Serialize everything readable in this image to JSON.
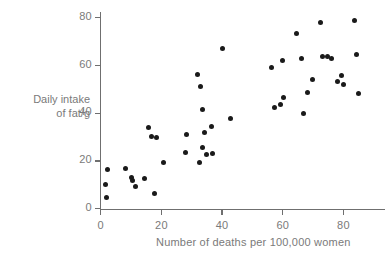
{
  "chart_data": {
    "type": "scatter",
    "title": "",
    "xlabel": "Number of deaths per 100,000 women",
    "ylabel": "Daily intake of fat/g",
    "ylabel_line1": "Daily intake",
    "ylabel_line2": "of fat/g",
    "xlim": [
      0,
      88
    ],
    "ylim": [
      0,
      84
    ],
    "xticks": [
      0,
      20,
      40,
      60,
      80
    ],
    "yticks": [
      0,
      20,
      40,
      60,
      80
    ],
    "xtick_labels": [
      "0",
      "20",
      "40",
      "60",
      "80"
    ],
    "ytick_labels": [
      "0",
      "20",
      "40",
      "60",
      "80"
    ],
    "grid": false,
    "legend": "none",
    "marker_color": "#1a1a1a",
    "axis_color": "#6f6f6f",
    "text_color": "#7a7a7a",
    "points": [
      {
        "x": 2.1,
        "y": 16.6
      },
      {
        "x": 1.5,
        "y": 10.3
      },
      {
        "x": 1.9,
        "y": 4.7
      },
      {
        "x": 8.1,
        "y": 16.8
      },
      {
        "x": 10.1,
        "y": 13.1
      },
      {
        "x": 11.4,
        "y": 9.2
      },
      {
        "x": 10.6,
        "y": 11.9
      },
      {
        "x": 14.5,
        "y": 12.6
      },
      {
        "x": 17.8,
        "y": 6.3
      },
      {
        "x": 15.6,
        "y": 34.2
      },
      {
        "x": 16.9,
        "y": 30.3
      },
      {
        "x": 18.4,
        "y": 30.0
      },
      {
        "x": 20.8,
        "y": 19.4
      },
      {
        "x": 27.8,
        "y": 23.6
      },
      {
        "x": 28.2,
        "y": 31.0
      },
      {
        "x": 31.8,
        "y": 56.2
      },
      {
        "x": 32.8,
        "y": 51.3
      },
      {
        "x": 33.4,
        "y": 41.5
      },
      {
        "x": 32.7,
        "y": 19.4
      },
      {
        "x": 33.5,
        "y": 25.8
      },
      {
        "x": 34.1,
        "y": 31.7
      },
      {
        "x": 34.8,
        "y": 22.8
      },
      {
        "x": 36.4,
        "y": 34.5
      },
      {
        "x": 36.9,
        "y": 23.3
      },
      {
        "x": 40.2,
        "y": 67.2
      },
      {
        "x": 42.7,
        "y": 37.6
      },
      {
        "x": 56.4,
        "y": 59.2
      },
      {
        "x": 57.4,
        "y": 42.4
      },
      {
        "x": 59.3,
        "y": 43.6
      },
      {
        "x": 59.9,
        "y": 62.0
      },
      {
        "x": 60.3,
        "y": 46.5
      },
      {
        "x": 64.5,
        "y": 73.3
      },
      {
        "x": 66.2,
        "y": 62.8
      },
      {
        "x": 66.8,
        "y": 39.8
      },
      {
        "x": 68.3,
        "y": 48.7
      },
      {
        "x": 69.9,
        "y": 54.0
      },
      {
        "x": 72.5,
        "y": 78.1
      },
      {
        "x": 73.0,
        "y": 63.6
      },
      {
        "x": 74.6,
        "y": 63.6
      },
      {
        "x": 76.1,
        "y": 63.0
      },
      {
        "x": 78.1,
        "y": 53.4
      },
      {
        "x": 79.5,
        "y": 56.0
      },
      {
        "x": 80.1,
        "y": 52.2
      },
      {
        "x": 83.7,
        "y": 78.7
      },
      {
        "x": 84.3,
        "y": 64.7
      },
      {
        "x": 84.9,
        "y": 48.3
      }
    ]
  },
  "axes": {
    "x_title": "Number of deaths per 100,000 women",
    "y_title_line1": "Daily intake",
    "y_title_line2": "of fat/g"
  }
}
